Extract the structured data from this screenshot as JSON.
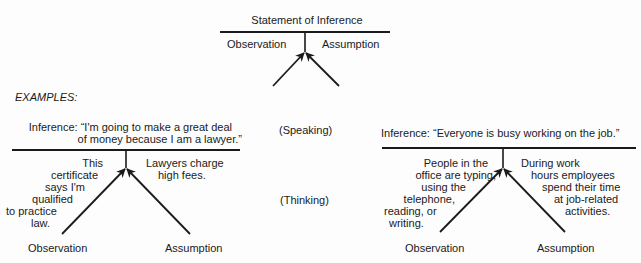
{
  "generic": {
    "title": "Statement of Inference",
    "left_label": "Observation",
    "right_label": "Assumption"
  },
  "examples_heading": "EXAMPLES:",
  "mode_labels": {
    "speaking": "(Speaking)",
    "thinking": "(Thinking)"
  },
  "example_1": {
    "inference_line1": "Inference: “I'm going to make a great deal",
    "inference_line2": "of money because I am a lawyer.”",
    "observation_text": [
      "This",
      "certificate",
      "says I'm",
      "qualified",
      "to practice",
      "law."
    ],
    "assumption_text": [
      "Lawyers charge",
      "high fees."
    ],
    "observation_label": "Observation",
    "assumption_label": "Assumption"
  },
  "example_2": {
    "inference": "Inference: “Everyone is busy working on the job.”",
    "observation_text": [
      "People in the",
      "office are typing,",
      "using the",
      "telephone,",
      "reading, or",
      "writing."
    ],
    "assumption_text": [
      "During work",
      "hours employees",
      "spend their time",
      "at job-related",
      "activities."
    ],
    "observation_label": "Observation",
    "assumption_label": "Assumption"
  }
}
